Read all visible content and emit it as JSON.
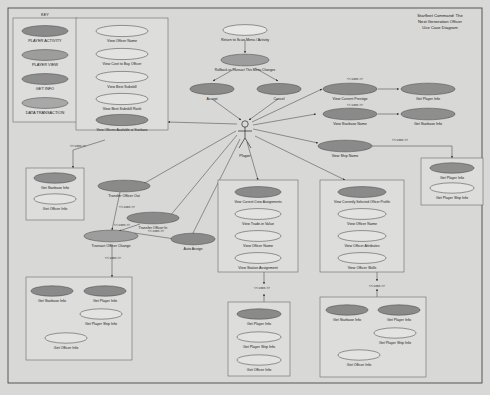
{
  "diagram": {
    "title_lines": [
      "Starfleet Command: The",
      "Next Generation Officer",
      "Use Case Diagram"
    ],
    "actor": {
      "name": "Player"
    },
    "uses_label": "<< uses >>",
    "colors": {
      "player_activity": "#8a8a8a",
      "player_view": "#9d9d9d",
      "get_info": "#8e8e8e",
      "data_transaction": "#a8a8a8",
      "light": "#e3e3e1",
      "canvas": "#d8d8d6",
      "panel": "#dddddb",
      "stroke": "#4a4a4a"
    },
    "key": {
      "title": "KEY",
      "items": [
        {
          "label": "PLAYER ACTIVITY",
          "fill": "#8a8a8a"
        },
        {
          "label": "PLAYER VIEW",
          "fill": "#9d9d9d"
        },
        {
          "label": "GET INFO",
          "fill": "#8e8e8e"
        },
        {
          "label": "DATA TRANSACTION",
          "fill": "#a8a8a8"
        }
      ]
    },
    "groups": {
      "officer_browse": {
        "name": "officer-browse-group",
        "items": [
          {
            "label": "View Officer Name",
            "fill": "#e3e3e1"
          },
          {
            "label": "View Cost to Buy Officer",
            "fill": "#e3e3e1"
          },
          {
            "label": "View Best Subskill",
            "fill": "#e3e3e1"
          },
          {
            "label": "View Best Subskill Rank",
            "fill": "#e3e3e1"
          },
          {
            "label": "View Officers Available at Starbase",
            "fill": "#8e8e8e"
          }
        ]
      },
      "transfer_info": {
        "name": "transfer-info-group",
        "items": [
          {
            "label": "Get Starbase Info",
            "fill": "#8e8e8e"
          },
          {
            "label": "Get Officer Info",
            "fill": "#e3e3e1"
          }
        ]
      },
      "transact_info": {
        "name": "transact-info-group",
        "items": [
          {
            "label": "Get Starbase Info",
            "fill": "#8e8e8e"
          },
          {
            "label": "Get Player Info",
            "fill": "#8e8e8e"
          },
          {
            "label": "Get Player Ship Info",
            "fill": "#e3e3e1"
          },
          {
            "label": "Get Officer Info",
            "fill": "#e3e3e1"
          }
        ]
      },
      "crew_assignments": {
        "name": "crew-assignments-group",
        "items": [
          {
            "label": "View Current Crew Assignments",
            "fill": "#8a8a8a"
          },
          {
            "label": "View Trade-in Value",
            "fill": "#e3e3e1"
          },
          {
            "label": "View Officer Name",
            "fill": "#e3e3e1"
          },
          {
            "label": "View Station Assignment",
            "fill": "#e3e3e1"
          }
        ]
      },
      "crew_info": {
        "name": "crew-info-group",
        "items": [
          {
            "label": "Get Player Info",
            "fill": "#8e8e8e"
          },
          {
            "label": "Get Player Ship Info",
            "fill": "#e3e3e1"
          },
          {
            "label": "Get Officer Info",
            "fill": "#e3e3e1"
          }
        ]
      },
      "officer_profile": {
        "name": "officer-profile-group",
        "items": [
          {
            "label": "View Currently Selected Officer Profile",
            "fill": "#8a8a8a"
          },
          {
            "label": "View Officer Name",
            "fill": "#e3e3e1"
          },
          {
            "label": "View Officer Attributes",
            "fill": "#e3e3e1"
          },
          {
            "label": "View Officer Skills",
            "fill": "#e3e3e1"
          }
        ]
      },
      "profile_info": {
        "name": "profile-info-group",
        "items": [
          {
            "label": "Get Starbase Info",
            "fill": "#8e8e8e"
          },
          {
            "label": "Get Player Info",
            "fill": "#8e8e8e"
          },
          {
            "label": "Get Player Ship Info",
            "fill": "#e3e3e1"
          },
          {
            "label": "Get Officer Info",
            "fill": "#e3e3e1"
          }
        ]
      },
      "ship_name_info": {
        "name": "ship-name-info-group",
        "items": [
          {
            "label": "Get Player Info",
            "fill": "#8e8e8e"
          },
          {
            "label": "Get Player Ship Info",
            "fill": "#e3e3e1"
          }
        ]
      }
    },
    "use_cases": {
      "return_to_scan": {
        "label": "Return to Scan Menu / Activity",
        "fill": "#e8e8e6"
      },
      "rollback": {
        "label": "Rollback or Transact This Menu Changes",
        "fill": "#9d9d9d"
      },
      "accept": {
        "label": "Accept",
        "fill": "#8a8a8a"
      },
      "cancel": {
        "label": "Cancel",
        "fill": "#8a8a8a"
      },
      "view_prestige": {
        "label": "View Current Prestige",
        "fill": "#8a8a8a"
      },
      "get_player_info_1": {
        "label": "Get Player Info",
        "fill": "#8e8e8e"
      },
      "view_starbase_name": {
        "label": "View Starbase Name",
        "fill": "#8a8a8a"
      },
      "get_starbase_info_1": {
        "label": "Get Starbase Info",
        "fill": "#8e8e8e"
      },
      "view_ship_name": {
        "label": "View Ship Name",
        "fill": "#8a8a8a"
      },
      "transfer_out": {
        "label": "Transfer Officer Out",
        "fill": "#8a8a8a"
      },
      "transfer_in": {
        "label": "Transfer Officer In",
        "fill": "#8a8a8a"
      },
      "transact_change": {
        "label": "Transact Officer Change",
        "fill": "#9d9d9d"
      },
      "auto_assign": {
        "label": "Auto Assign",
        "fill": "#8a8a8a"
      }
    }
  }
}
